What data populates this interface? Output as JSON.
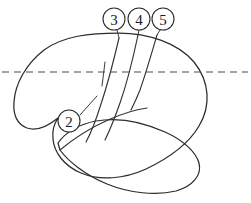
{
  "figure": {
    "background_color": "#ffffff",
    "stroke_color": "#2b2b2b",
    "dashed_color": "#4a4a4a",
    "width": 251,
    "height": 203
  },
  "reference_line": {
    "name": "horizontal-dashed-reference-line",
    "style": "dashed",
    "y": 72,
    "x_start": 2,
    "x_end": 248,
    "dash_pattern": "7 5",
    "color": "#4a4a4a"
  },
  "callouts": [
    {
      "id": "callout-2",
      "label": "2",
      "cx": 69,
      "cy": 121,
      "r": 11,
      "leader": {
        "x1": 80,
        "y1": 115,
        "x2": 97,
        "y2": 96
      }
    },
    {
      "id": "callout-3",
      "label": "3",
      "cx": 114,
      "cy": 19,
      "r": 11,
      "leader": {
        "x1": 117,
        "y1": 30,
        "x2": 119,
        "y2": 38
      }
    },
    {
      "id": "callout-4",
      "label": "4",
      "cx": 139,
      "cy": 19,
      "r": 11,
      "leader": {
        "x1": 139,
        "y1": 30,
        "x2": 138,
        "y2": 35
      }
    },
    {
      "id": "callout-5",
      "label": "5",
      "cx": 163,
      "cy": 19,
      "r": 11,
      "leader": {
        "x1": 160,
        "y1": 30,
        "x2": 157,
        "y2": 35
      }
    }
  ],
  "outline": {
    "name": "cerebrum-outline",
    "upper_mass_path": "M 119 33 C 148 33 178 43 194 62 C 210 82 211 106 199 126 C 188 145 167 159 146 169 C 124 179 100 181 81 173 C 64 166 54 152 53 139 C 52 131 54 124 58 118 C 47 127 36 131 27 128 C 17 124 13 114 14 102 C 15 84 26 64 44 50 C 63 36 90 33 119 33 Z",
    "temporal_lobe_path": "M 58 143 C 66 132 80 124 96 121 C 118 117 143 122 165 132 C 183 140 196 152 199 163 C 202 175 193 186 176 191 C 156 196 129 193 107 184 C 85 175 68 161 60 150 Z"
  },
  "sulci": [
    {
      "id": "sulcus-3",
      "name": "sulcus-line-3",
      "path": "M 119 38 C 115 55 109 80 101 104 C 96 120 91 133 86 142"
    },
    {
      "id": "sulcus-4",
      "name": "sulcus-line-4",
      "path": "M 138 35 C 134 54 128 80 120 103 C 114 120 109 132 105 140"
    },
    {
      "id": "sulcus-5",
      "name": "sulcus-line-5",
      "path": "M 157 35 C 152 52 146 73 140 90 C 136 100 133 106 131 110"
    }
  ],
  "branch_line": {
    "id": "branch-2",
    "name": "short-branch-line",
    "path": "M 105 62 C 104 70 103 78 102 86"
  },
  "fissure": {
    "id": "sylvian-fissure",
    "name": "sylvian-fissure-curve",
    "path": "M 60 150 C 72 140 90 128 108 120 C 124 113 138 109 147 108"
  },
  "legend": {
    "numbers": [
      "2",
      "3",
      "4",
      "5"
    ]
  }
}
